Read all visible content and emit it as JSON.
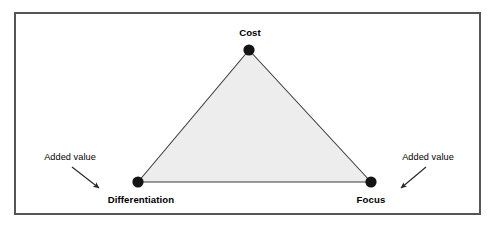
{
  "diagram": {
    "type": "strategy-triangle",
    "frame": {
      "border_color": "#555558",
      "background_color": "#ffffff"
    },
    "triangle": {
      "fill_color": "#ededed",
      "stroke_color": "#3a3a3a",
      "vertices": [
        {
          "id": "cost",
          "label": "Cost",
          "x": 249,
          "y": 50,
          "label_position": "above"
        },
        {
          "id": "differentiation",
          "label": "Differentiation",
          "x": 138,
          "y": 182,
          "label_position": "below"
        },
        {
          "id": "focus",
          "label": "Focus",
          "x": 371,
          "y": 182,
          "label_position": "below"
        }
      ],
      "node_color": "#141414",
      "node_radius": 5.5
    },
    "annotations": [
      {
        "id": "added-value-left",
        "label": "Added value",
        "text_x": 70,
        "text_y": 158,
        "arrow_from_x": 72,
        "arrow_from_y": 167,
        "arrow_to_x": 101,
        "arrow_to_y": 190,
        "points_to": "differentiation"
      },
      {
        "id": "added-value-right",
        "label": "Added value",
        "text_x": 428,
        "text_y": 158,
        "arrow_from_x": 426,
        "arrow_from_y": 167,
        "arrow_to_x": 399,
        "arrow_to_y": 190,
        "points_to": "focus"
      }
    ],
    "arrow_color": "#262626"
  }
}
